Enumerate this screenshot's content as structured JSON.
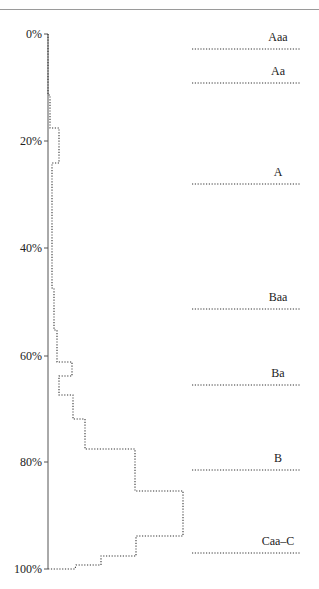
{
  "chart_data": {
    "type": "line",
    "subtype": "step-distribution (vertical)",
    "title": "",
    "xlabel": "",
    "ylabel": "",
    "yaxis": {
      "orientation": "inverted",
      "ylim": [
        0,
        100
      ],
      "ticks": [
        "0%",
        "20%",
        "40%",
        "60%",
        "80%",
        "100%"
      ],
      "tick_values": [
        0,
        20,
        40,
        60,
        80,
        100
      ]
    },
    "grid": false,
    "legend": null,
    "series": [
      {
        "name": "distribution",
        "style": "dotted",
        "color": "#333333",
        "points_percentile_vs_width": [
          {
            "y": 0,
            "x": 0
          },
          {
            "y": 11.4,
            "x": 0
          },
          {
            "y": 11.4,
            "x": 1
          },
          {
            "y": 17.6,
            "x": 1
          },
          {
            "y": 17.6,
            "x": 5
          },
          {
            "y": 24.1,
            "x": 5
          },
          {
            "y": 24.1,
            "x": 2
          },
          {
            "y": 47.5,
            "x": 2
          },
          {
            "y": 47.5,
            "x": 3
          },
          {
            "y": 55.3,
            "x": 3
          },
          {
            "y": 55.3,
            "x": 4
          },
          {
            "y": 61.3,
            "x": 4
          },
          {
            "y": 61.3,
            "x": 11
          },
          {
            "y": 63.9,
            "x": 11
          },
          {
            "y": 63.9,
            "x": 5
          },
          {
            "y": 67.5,
            "x": 5
          },
          {
            "y": 67.5,
            "x": 12
          },
          {
            "y": 71.9,
            "x": 12
          },
          {
            "y": 71.9,
            "x": 18
          },
          {
            "y": 77.6,
            "x": 18
          },
          {
            "y": 77.6,
            "x": 42
          },
          {
            "y": 85.4,
            "x": 42
          },
          {
            "y": 85.4,
            "x": 64
          },
          {
            "y": 93.8,
            "x": 64
          },
          {
            "y": 93.8,
            "x": 41
          },
          {
            "y": 97.6,
            "x": 41
          },
          {
            "y": 97.6,
            "x": 25
          },
          {
            "y": 99.3,
            "x": 25
          },
          {
            "y": 99.3,
            "x": 13
          },
          {
            "y": 100,
            "x": 13
          },
          {
            "y": 100,
            "x": 0
          }
        ]
      }
    ],
    "annotations": [
      {
        "label": "Aaa",
        "y_percent": 2.8
      },
      {
        "label": "Aa",
        "y_percent": 9.2
      },
      {
        "label": "A",
        "y_percent": 28.0
      },
      {
        "label": "Baa",
        "y_percent": 51.4
      },
      {
        "label": "Ba",
        "y_percent": 65.6
      },
      {
        "label": "B",
        "y_percent": 81.5
      },
      {
        "label": "Caa–C",
        "y_percent": 97.0
      }
    ]
  },
  "axis": {
    "ticks": [
      {
        "label": "0%",
        "y": 34
      },
      {
        "label": "20%",
        "y": 141
      },
      {
        "label": "40%",
        "y": 248
      },
      {
        "label": "60%",
        "y": 356
      },
      {
        "label": "80%",
        "y": 462
      },
      {
        "label": "100%",
        "y": 569
      }
    ]
  },
  "ratings": [
    {
      "label": "Aaa",
      "y": 49
    },
    {
      "label": "Aa",
      "y": 83
    },
    {
      "label": "A",
      "y": 184
    },
    {
      "label": "Baa",
      "y": 309
    },
    {
      "label": "Ba",
      "y": 385
    },
    {
      "label": "B",
      "y": 470
    },
    {
      "label": "Caa–C",
      "y": 553
    }
  ],
  "step_path_px": "48,34 48,95 50,95 50,128 59,128 59,163 52,163 52,288 54,288 54,330 57,330 57,362 72,362 72,376 59,376 59,395 73,395 73,419 85,419 85,449 135,449 135,491 183,491 183,536 136,536 136,556 101,556 101,565 76,565 75,569 48,569"
}
